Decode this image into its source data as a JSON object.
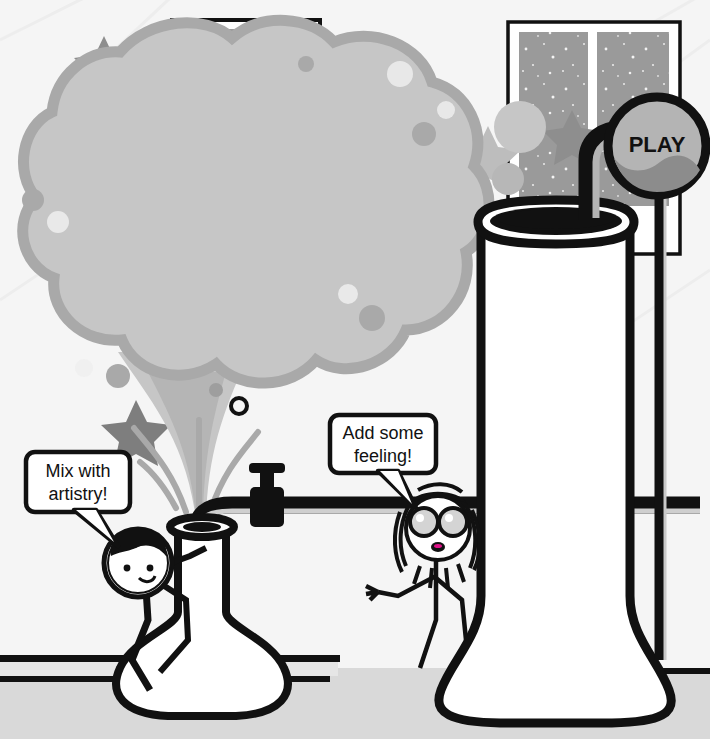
{
  "scene": {
    "title": "Music Expression Lab",
    "description": "Illustration of a chemistry lab where expression words bubble out of a flask and emotion words fill a tall beaker",
    "background_color": "#f5f5f5",
    "floor_color": "#d9d9d9",
    "ink_color": "#111111",
    "cloud_light": "#c6c6c6",
    "cloud_mid": "#a9a9a9",
    "cloud_dark": "#8e8e8e",
    "window_sky": "#9a9a9a",
    "knob_fill": "#b4b4b4",
    "knob_band": "#8c8c8c"
  },
  "cloud": {
    "name": "expression-word-cloud",
    "bubbles": [
      {
        "label": "QUIET",
        "cx": 182,
        "cy": 118,
        "r": 66,
        "fs": 26,
        "rot": -16
      },
      {
        "label": "SLOW",
        "cx": 92,
        "cy": 158,
        "r": 50,
        "fs": 24,
        "rot": -13
      },
      {
        "label": "HEAVY",
        "cx": 164,
        "cy": 203,
        "r": 43,
        "fs": 21,
        "rot": -2
      },
      {
        "label": "WITH",
        "cx": 255,
        "cy": 152,
        "r": 0,
        "fs": 14,
        "rot": -8,
        "sub": true
      },
      {
        "label": "PEDAL",
        "cx": 256,
        "cy": 171,
        "r": 62,
        "fs": 24,
        "rot": -8
      },
      {
        "label": "DANCING",
        "cx": 334,
        "cy": 132,
        "r": 54,
        "fs": 23,
        "rot": -6
      },
      {
        "label": "WALKING",
        "cx": 386,
        "cy": 208,
        "r": 65,
        "fs": 23,
        "rot": -3
      },
      {
        "label": "FLOWING",
        "cx": 92,
        "cy": 257,
        "r": 58,
        "fs": 23,
        "rot": -4
      },
      {
        "label": "SOFT",
        "cx": 233,
        "cy": 247,
        "r": 44,
        "fs": 23,
        "rot": -8
      },
      {
        "label": "LOUD",
        "cx": 180,
        "cy": 304,
        "r": 62,
        "fs": 25,
        "rot": -3
      },
      {
        "label": "LIGHTLY",
        "cx": 292,
        "cy": 292,
        "r": 57,
        "fs": 23,
        "rot": -11
      }
    ]
  },
  "beaker": {
    "name": "emotion-beaker",
    "emotions": [
      "EXCITED",
      "JOYFUL",
      "HAPPY",
      "PEACEFUL",
      "CALM",
      "BORED",
      "SAD",
      "WORRIED",
      "FRUSTRATED",
      "SCARED",
      "ANGRY",
      "BLAH/NUMB"
    ]
  },
  "controls": {
    "play_knob_label": "PLAY"
  },
  "characters": [
    {
      "name": "boy-scientist",
      "speech": [
        "Mix with",
        "artistry!"
      ],
      "hair": "dark",
      "accessory": "round-helmet"
    },
    {
      "name": "girl-scientist",
      "speech": [
        "Add some",
        "feeling!"
      ],
      "hair": "long-straight",
      "accessory": "goggles"
    }
  ],
  "decor": {
    "stars": 4,
    "windows": 2
  }
}
